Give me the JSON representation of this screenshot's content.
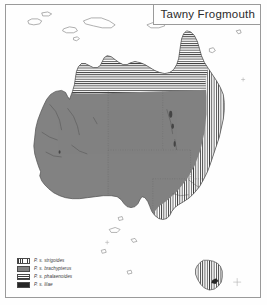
{
  "map": {
    "title": "Tawny Frogmouth",
    "region": "Australia",
    "colors": {
      "frame": "#9a9a9a",
      "land_solid": "#828282",
      "hatch_ink": "#3c3c3c",
      "dark_fill": "#262626",
      "ocean": "#fefefe",
      "coastline": "#555555",
      "state_border": "#6b6b6b",
      "river": "#4a4a4a"
    },
    "legend": {
      "items": [
        {
          "label": "P. s. strigoides",
          "pattern": "vertical-stripes",
          "swatch_class": "sw-vert",
          "icon": "vertical-hatch-swatch"
        },
        {
          "label": "P. s. brachypterus",
          "pattern": "solid-gray",
          "swatch_class": "sw-solid",
          "icon": "solid-fill-swatch"
        },
        {
          "label": "P. s. phalaenoides",
          "pattern": "horizontal-stripes",
          "swatch_class": "sw-horz",
          "icon": "horizontal-hatch-swatch"
        },
        {
          "label": "P. s. lilae",
          "pattern": "dark-solid",
          "swatch_class": "sw-dark",
          "icon": "dark-fill-swatch"
        }
      ]
    },
    "distribution_regions": [
      {
        "name": "eastern-seaboard",
        "subspecies": "P. s. strigoides",
        "pattern": "vertical-stripes"
      },
      {
        "name": "tasmania",
        "subspecies": "P. s. strigoides",
        "pattern": "vertical-stripes"
      },
      {
        "name": "inland-and-western",
        "subspecies": "P. s. brachypterus",
        "pattern": "solid-gray"
      },
      {
        "name": "top-end-and-cape-york",
        "subspecies": "P. s. phalaenoides",
        "pattern": "horizontal-stripes"
      },
      {
        "name": "melville-island",
        "subspecies": "P. s. lilae",
        "pattern": "dark-solid"
      }
    ]
  }
}
